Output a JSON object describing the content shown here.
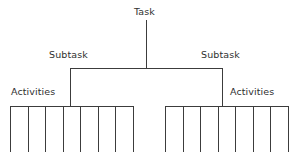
{
  "diagram": {
    "kind": "work-breakdown-structure-tree",
    "background_color": "#ffffff",
    "line_color": "#3c3c3c",
    "text_color": "#2f2f2f",
    "labels": {
      "task": "Task",
      "subtask_left": "Subtask",
      "subtask_right": "Subtask",
      "activities_left": "Activities",
      "activities_right": "Activities"
    },
    "levels": [
      {
        "name": "task",
        "label": "Task",
        "count": 1
      },
      {
        "name": "subtask",
        "label": "Subtask",
        "count": 2
      },
      {
        "name": "activities",
        "label": "Activities",
        "count": 14
      }
    ],
    "geometry": {
      "width": 293,
      "height": 159,
      "task_stem": {
        "x": 146,
        "y_top": 20,
        "y_bottom": 68
      },
      "connector_bar": {
        "y": 68,
        "x_left": 70,
        "x_right": 222
      },
      "left_branch": {
        "x": 70,
        "y_top": 68,
        "y_bottom": 106
      },
      "right_branch": {
        "x": 222,
        "y_top": 68,
        "y_bottom": 106
      },
      "left_comb": {
        "bar_y": 106,
        "x_start": 10,
        "x_end": 133,
        "tooth_bottom": 152,
        "tooth_count": 8,
        "cell_count": 7
      },
      "right_comb": {
        "bar_y": 106,
        "x_start": 165,
        "x_end": 288,
        "tooth_bottom": 152,
        "tooth_count": 8,
        "cell_count": 7
      }
    }
  }
}
